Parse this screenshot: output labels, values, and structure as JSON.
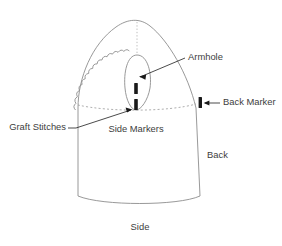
{
  "diagram": {
    "colors": {
      "outline": "#8d8d8d",
      "dashed_guide": "#9a9a9a",
      "dotted_center": "#b4b4b4",
      "marker": "#1a1a1a",
      "leader_line": "#2b2b2b",
      "text": "#3d3d3d",
      "background": "#ffffff"
    },
    "labels": {
      "armhole": "Armhole",
      "back_marker": "Back Marker",
      "side_markers": "Side Markers",
      "graft_stitches": "Graft Stitches",
      "back": "Back",
      "side": "Side"
    },
    "parts": {
      "garment_body": "garment-body-outline",
      "scalloped_edge": "graft-stitch-scalloped-edge",
      "armhole_opening": "armhole-oval",
      "center_guide": "dotted-center-line",
      "waist_guide": "dashed-waist-line",
      "marker_upper": "side-marker-upper-tick",
      "marker_lower": "side-marker-lower-tick",
      "marker_back": "back-marker-tick"
    }
  }
}
